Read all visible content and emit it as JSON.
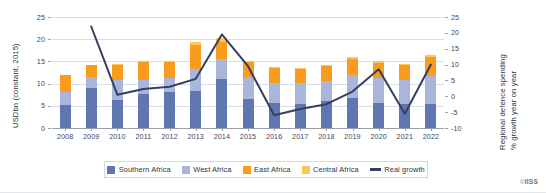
{
  "chart_data": {
    "type": "bar",
    "title": "",
    "subtitle": "",
    "xlabel": "",
    "ylabel": "USDbn (constant, 2015)",
    "ylabel_secondary": "Regional defence spending\n% growth year on year",
    "ylabel_secondary_line1": "Regional defence spending",
    "ylabel_secondary_line2": "% growth year on year",
    "ylim": [
      0,
      25
    ],
    "ylim_secondary": [
      -10,
      25
    ],
    "yticks": [
      0,
      5,
      10,
      15,
      20,
      25
    ],
    "yticks_secondary": [
      -10,
      -5,
      0,
      5,
      10,
      15,
      20,
      25
    ],
    "grid": true,
    "legend_position": "bottom",
    "categories": [
      "2008",
      "2009",
      "2010",
      "2011",
      "2012",
      "2013",
      "2014",
      "2015",
      "2016",
      "2017",
      "2018",
      "2019",
      "2020",
      "2021",
      "2022"
    ],
    "series": [
      {
        "name": "Southern Africa",
        "color": "#5f76b0",
        "type": "bar",
        "values": [
          5.2,
          9.0,
          6.4,
          7.6,
          8.2,
          8.4,
          11.0,
          6.5,
          5.6,
          5.5,
          6.0,
          6.8,
          5.7,
          5.3,
          5.4
        ]
      },
      {
        "name": "West Africa",
        "color": "#a9b5d9",
        "type": "bar",
        "values": [
          3.0,
          2.4,
          4.4,
          3.2,
          3.0,
          4.8,
          4.5,
          5.0,
          4.5,
          4.6,
          4.6,
          5.2,
          5.5,
          5.5,
          6.3
        ]
      },
      {
        "name": "East Africa",
        "color": "#f99b1c",
        "type": "bar",
        "values": [
          3.7,
          2.8,
          3.5,
          4.0,
          3.8,
          5.5,
          3.9,
          3.3,
          3.4,
          3.1,
          3.3,
          3.6,
          3.5,
          3.3,
          4.4
        ]
      },
      {
        "name": "Central Africa",
        "color": "#fcc65c",
        "type": "bar",
        "values": [
          0.0,
          0.0,
          0.2,
          0.2,
          0.2,
          0.6,
          0.8,
          0.3,
          0.3,
          0.3,
          0.3,
          0.3,
          0.3,
          0.3,
          0.4
        ]
      },
      {
        "name": "Real growth",
        "color": "#343f63",
        "type": "line",
        "axis": "secondary",
        "values": [
          null,
          22.0,
          0.5,
          2.3,
          3.0,
          5.5,
          19.5,
          9.5,
          -6.0,
          -4.0,
          -2.5,
          1.5,
          8.5,
          -5.5,
          10.0
        ]
      }
    ],
    "totals": [
      11.9,
      14.2,
      14.5,
      15.0,
      15.2,
      19.3,
      20.2,
      15.1,
      13.8,
      13.5,
      14.2,
      15.9,
      15.0,
      14.4,
      16.5
    ]
  },
  "legend": {
    "items": [
      {
        "label": "Southern Africa",
        "marker": "square",
        "color": "#5f76b0"
      },
      {
        "label": "West Africa",
        "marker": "square",
        "color": "#a9b5d9"
      },
      {
        "label": "East Africa",
        "marker": "square",
        "color": "#f99b1c"
      },
      {
        "label": "Central Africa",
        "marker": "square",
        "color": "#fcc65c"
      },
      {
        "label": "Real growth",
        "marker": "line",
        "color": "#343f63"
      }
    ]
  },
  "credit": {
    "mark": "©",
    "name": "IISS"
  }
}
